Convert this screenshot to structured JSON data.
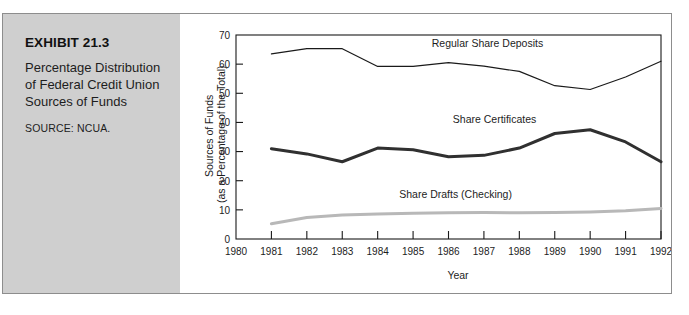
{
  "exhibit": {
    "number": "EXHIBIT 21.3",
    "title": "Percentage Distribution of Federal Credit Union Sources of Funds",
    "source": "SOURCE: NCUA."
  },
  "chart_data": {
    "type": "line",
    "title": "",
    "xlabel": "Year",
    "ylabel": "Sources of Funds (as a Percentage of the Total)",
    "ylabel_line1": "Sources of Funds",
    "ylabel_line2": "(as a Percentage of the Total)",
    "xlim": [
      1980,
      1992
    ],
    "ylim": [
      0,
      70
    ],
    "yticks": [
      0,
      10,
      20,
      30,
      40,
      50,
      60,
      70
    ],
    "ytick_labels": [
      "0",
      "10",
      "20",
      "30",
      "40",
      "50",
      "60",
      "70"
    ],
    "xticks": [
      1980,
      1981,
      1982,
      1983,
      1984,
      1985,
      1986,
      1987,
      1988,
      1989,
      1990,
      1991,
      1992
    ],
    "xtick_labels": [
      "1980",
      "1981",
      "1982",
      "1983",
      "1984",
      "1985",
      "1986",
      "1987",
      "1988",
      "1989",
      "1990",
      "1991",
      "1992"
    ],
    "grid": false,
    "legend_position": "inline-annotations",
    "x": [
      1981,
      1982,
      1983,
      1984,
      1985,
      1986,
      1987,
      1988,
      1989,
      1990,
      1991,
      1992
    ],
    "series": [
      {
        "name": "Regular Share Deposits",
        "color": "#1a1a1a",
        "width": 1.2,
        "values": [
          63.5,
          65.3,
          65.3,
          59.2,
          59.2,
          60.5,
          59.3,
          57.5,
          52.6,
          51.3,
          55.6,
          61.0
        ],
        "label_x": 1987.1,
        "label_y": 66.0
      },
      {
        "name": "Share Certificates",
        "color": "#303030",
        "width": 3.0,
        "values": [
          31.0,
          29.2,
          26.5,
          31.2,
          30.6,
          28.2,
          28.7,
          31.2,
          36.2,
          37.5,
          33.3,
          26.5
        ],
        "label_x": 1987.3,
        "label_y": 39.8
      },
      {
        "name": "Share Drafts (Checking)",
        "color": "#b8b8b8",
        "width": 3.0,
        "values": [
          5.2,
          7.4,
          8.2,
          8.6,
          8.8,
          9.0,
          9.1,
          9.0,
          9.1,
          9.3,
          9.7,
          10.5
        ],
        "label_x": 1986.2,
        "label_y": 14.2
      }
    ]
  }
}
